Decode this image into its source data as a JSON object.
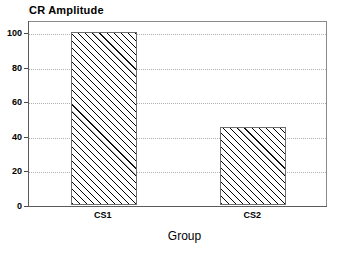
{
  "chart_data": {
    "type": "bar",
    "title": "CR Amplitude",
    "xlabel": "Group",
    "ylabel": "",
    "categories": [
      "CS1",
      "CS2"
    ],
    "values": [
      100,
      45
    ],
    "ylim": [
      0,
      100
    ],
    "yticks": [
      0,
      20,
      40,
      60,
      80,
      100
    ],
    "ytick_labels": [
      "0",
      "20",
      "40",
      "60",
      "80",
      "100"
    ],
    "grid": "horizontal-dotted",
    "legend": "none",
    "bar_fill": "diagonal-hatch",
    "colors": {
      "bar_edge": "#6e6e6e",
      "hatch": "#000000",
      "frame": "#8a8a8a",
      "gridline": "#b0b0b0",
      "axis": "#5a5a5a",
      "text": "#000000",
      "background": "#ffffff"
    }
  }
}
